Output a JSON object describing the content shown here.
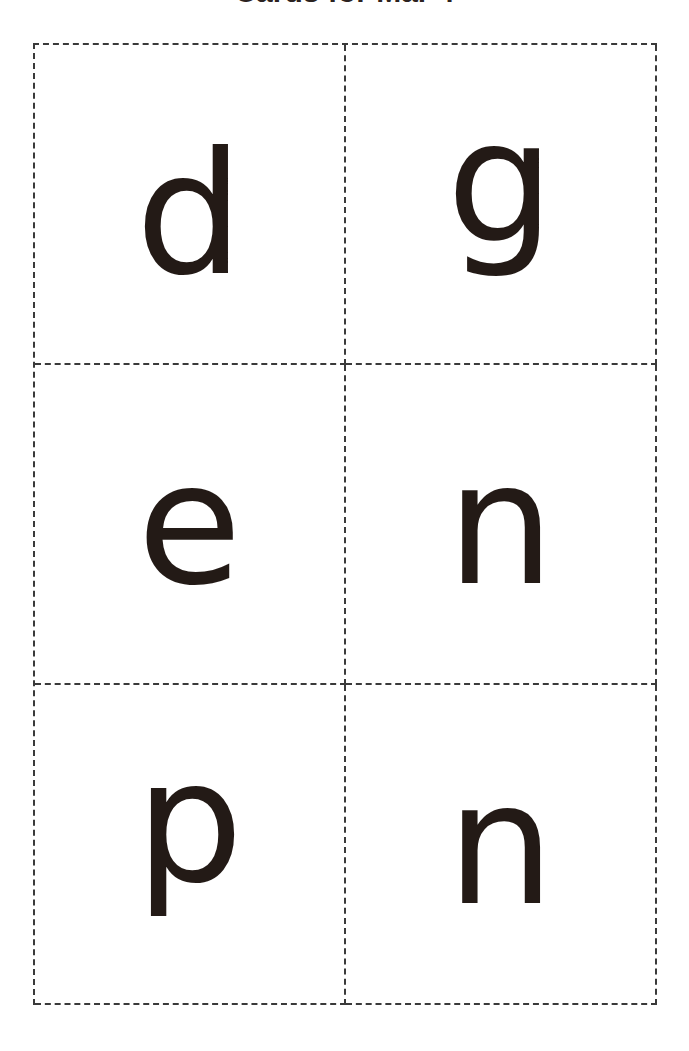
{
  "page": {
    "title": "Cards for Mar 4",
    "background_color": "#ffffff",
    "letter_color": "#231a16",
    "grid_line_color": "#3a3a3a",
    "columns": 2,
    "rows": 3
  },
  "cards": [
    {
      "letter": "d",
      "row": 1,
      "column": 1
    },
    {
      "letter": "g",
      "row": 1,
      "column": 2
    },
    {
      "letter": "e",
      "row": 2,
      "column": 1
    },
    {
      "letter": "n",
      "row": 2,
      "column": 2
    },
    {
      "letter": "p",
      "row": 3,
      "column": 1
    },
    {
      "letter": "n",
      "row": 3,
      "column": 2
    }
  ]
}
